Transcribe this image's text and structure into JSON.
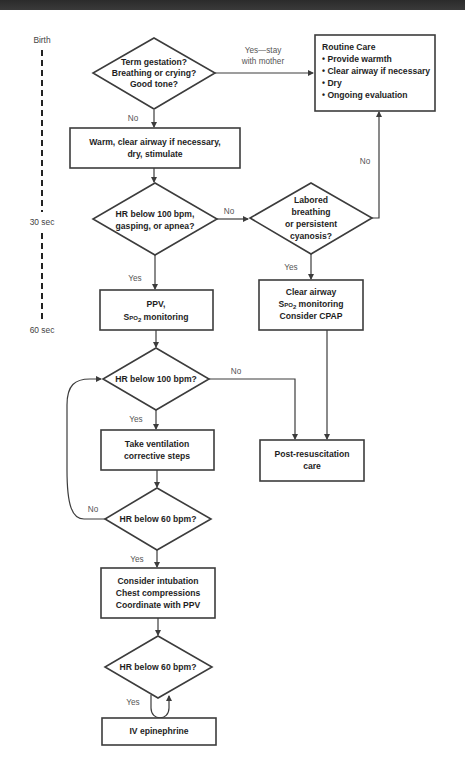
{
  "timeline": {
    "birth": "Birth",
    "t30": "30 sec",
    "t60": "60 sec"
  },
  "nodes": {
    "d_initial": [
      "Term gestation?",
      "Breathing or crying?",
      "Good tone?"
    ],
    "routine": {
      "title": "Routine Care",
      "items": [
        "• Provide warmth",
        "• Clear airway if necessary",
        "• Dry",
        "• Ongoing evaluation"
      ]
    },
    "warm": [
      "Warm, clear airway if necessary,",
      "dry, stimulate"
    ],
    "d_hr100_gasp": [
      "HR below 100 bpm,",
      "gasping, or apnea?"
    ],
    "d_labored": [
      "Labored",
      "breathing",
      "or persistent",
      "cyanosis?"
    ],
    "ppv": {
      "line1": "PPV,",
      "line2_pre": "S",
      "line2_sub": "PO",
      "line2_sub2": "2",
      "line2_post": " monitoring"
    },
    "clear": {
      "line1": "Clear airway",
      "line2_pre": "S",
      "line2_sub": "PO",
      "line2_sub2": "2",
      "line2_post": " monitoring",
      "line3": "Consider CPAP"
    },
    "d_hr100": "HR below 100 bpm?",
    "vent": [
      "Take ventilation",
      "corrective steps"
    ],
    "post": [
      "Post-resuscitation",
      "care"
    ],
    "d_hr60_a": "HR below 60 bpm?",
    "intub": [
      "Consider intubation",
      "Chest compressions",
      "Coordinate with PPV"
    ],
    "d_hr60_b": "HR below 60 bpm?",
    "iv": "IV epinephrine"
  },
  "edge_labels": {
    "yes_stay_1": "Yes—stay",
    "yes_stay_2": "with mother",
    "no_initial": "No",
    "no_labored_up": "No",
    "no_hr_gasp": "No",
    "yes_hr_gasp": "Yes",
    "yes_labored": "Yes",
    "no_hr100": "No",
    "yes_hr100": "Yes",
    "no_hr60_a": "No",
    "yes_hr60_a": "Yes",
    "yes_hr60_b": "Yes"
  }
}
